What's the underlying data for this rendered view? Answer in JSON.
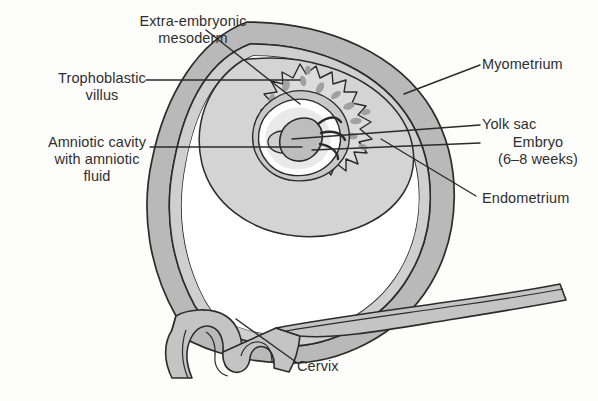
{
  "figure": {
    "colors": {
      "wall_outer": "#b9b9b9",
      "wall_inner": "#c9c9c9",
      "decidua": "#d2d2d2",
      "villi": "#d9d9d9",
      "chorion": "#c4c4c4",
      "amnion_fluid": "#ffffff",
      "embryo": "#bdbdbd",
      "outline": "#2b2b2b",
      "background": "#fdfdfc",
      "label_text": "#2f2f2f"
    }
  },
  "labels": {
    "mesoderm": "Extra-embryonic\nmesoderm",
    "trophoblastic_villus": "Trophoblastic\nvillus",
    "amniotic_cavity": "Amniotic cavity\nwith amniotic\nfluid",
    "myometrium": "Myometrium",
    "yolk_sac": "Yolk sac",
    "embryo": "Embryo\n(6–8 weeks)",
    "endometrium": "Endometrium",
    "cervix": "Cervix"
  }
}
